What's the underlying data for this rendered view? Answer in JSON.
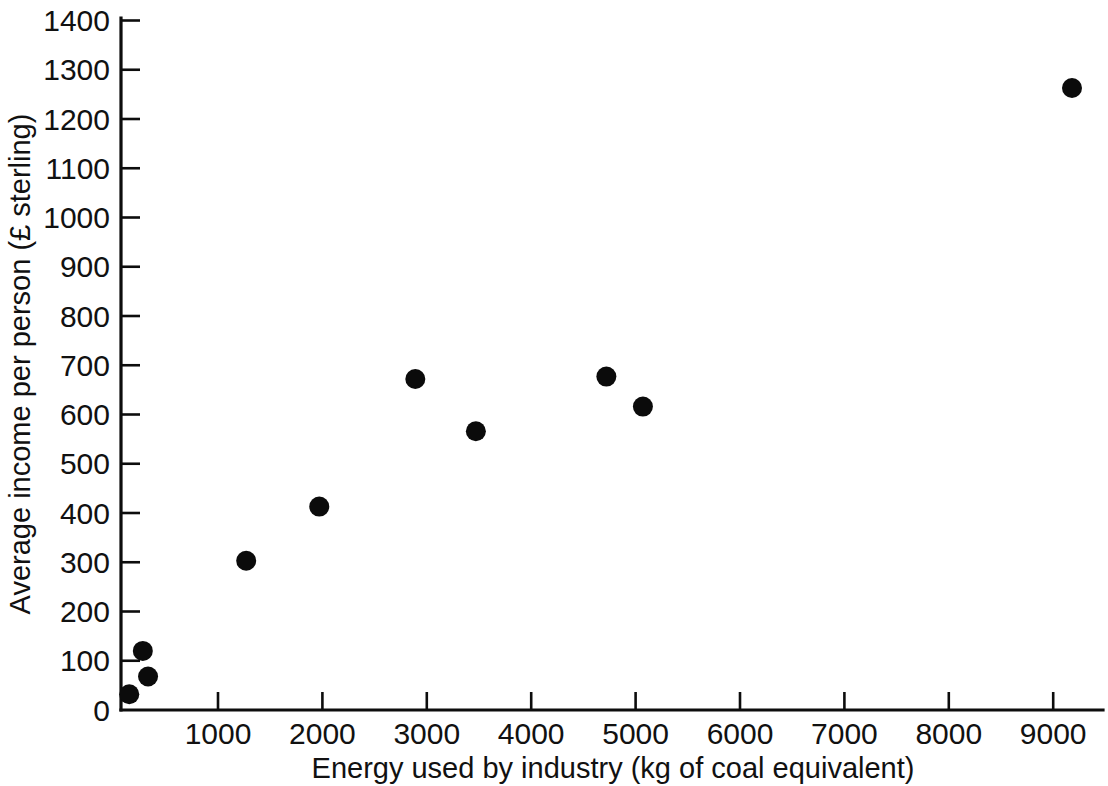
{
  "chart_data": {
    "type": "scatter",
    "title": "",
    "xlabel": "Energy used by industry (kg of coal equivalent)",
    "ylabel": "Average income per person (£ sterling)",
    "xlim": [
      0,
      9500
    ],
    "ylim": [
      0,
      1400
    ],
    "xticks": [
      1000,
      2000,
      3000,
      4000,
      5000,
      6000,
      7000,
      8000,
      9000
    ],
    "xtick_labels": [
      "1000",
      "2000",
      "3000",
      "4000",
      "5000",
      "6000",
      "7000",
      "8000",
      "9000"
    ],
    "yticks": [
      0,
      100,
      200,
      300,
      400,
      500,
      600,
      700,
      800,
      900,
      1000,
      1100,
      1200,
      1300,
      1400
    ],
    "ytick_labels": [
      "0",
      "100",
      "200",
      "300",
      "400",
      "500",
      "600",
      "700",
      "800",
      "900",
      "1000",
      "1100",
      "1200",
      "1300",
      "1400"
    ],
    "grid": false,
    "legend": false,
    "marker": "filled-circle",
    "marker_color": "#0b0b0b",
    "marker_size_px": 20,
    "series": [
      {
        "name": "Countries",
        "points": [
          {
            "x": 150,
            "y": 32
          },
          {
            "x": 280,
            "y": 120
          },
          {
            "x": 330,
            "y": 68
          },
          {
            "x": 1270,
            "y": 303
          },
          {
            "x": 1970,
            "y": 413
          },
          {
            "x": 2890,
            "y": 672
          },
          {
            "x": 3470,
            "y": 566
          },
          {
            "x": 4720,
            "y": 677
          },
          {
            "x": 5070,
            "y": 616
          },
          {
            "x": 9180,
            "y": 1263
          }
        ]
      }
    ]
  },
  "axes": {
    "x_axis_label": "Energy used by industry (kg of coal equivalent)",
    "y_axis_label": "Average income per person (£ sterling)"
  }
}
